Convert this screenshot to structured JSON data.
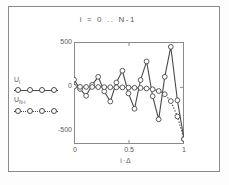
{
  "window": {
    "title": "i = 0 .. N-1"
  },
  "legend": {
    "position": "left",
    "entries": [
      {
        "label_main": "U",
        "label_sub": "i",
        "style": "solid-with-circles",
        "name": "series-u-i"
      },
      {
        "label_main": "U",
        "label_sub": "N-i",
        "style": "dotted-with-circles",
        "name": "series-u-n-minus-i"
      }
    ]
  },
  "axes": {
    "y_ticks": [
      "500",
      "0",
      "-500"
    ],
    "x_ticks": [
      "0",
      "0.5",
      "1"
    ],
    "xlabel": "i·Δ",
    "ylabel": ""
  },
  "chart_data": {
    "type": "line",
    "title": "i = 0 .. N-1",
    "xlabel": "i·Δ",
    "ylabel": "",
    "xlim": [
      0,
      1
    ],
    "ylim": [
      -700,
      560
    ],
    "grid": false,
    "legend_position": "left-outside",
    "series": [
      {
        "name": "U_i",
        "style": "solid",
        "marker": "circle-open",
        "color": "#4a4a4a",
        "x": [
          0.0,
          0.055,
          0.11,
          0.165,
          0.22,
          0.275,
          0.33,
          0.385,
          0.44,
          0.495,
          0.55,
          0.605,
          0.66,
          0.715,
          0.77,
          0.825,
          0.88,
          0.94,
          1.0
        ],
        "y": [
          95,
          -20,
          -105,
          30,
          130,
          -50,
          -175,
          60,
          205,
          -75,
          -265,
          90,
          320,
          -110,
          -395,
          130,
          500,
          -160,
          -640
        ]
      },
      {
        "name": "U_N-i",
        "style": "dotted",
        "marker": "circle-open",
        "color": "#4a4a4a",
        "x": [
          0.0,
          0.055,
          0.11,
          0.165,
          0.22,
          0.275,
          0.33,
          0.385,
          0.44,
          0.495,
          0.55,
          0.605,
          0.66,
          0.715,
          0.77,
          0.825,
          0.88,
          0.94,
          1.0
        ],
        "y": [
          8,
          6,
          5,
          4,
          3,
          2,
          1,
          0,
          -1,
          -3,
          -5,
          -8,
          -14,
          -24,
          -45,
          -85,
          -170,
          -360,
          -640
        ]
      }
    ]
  }
}
